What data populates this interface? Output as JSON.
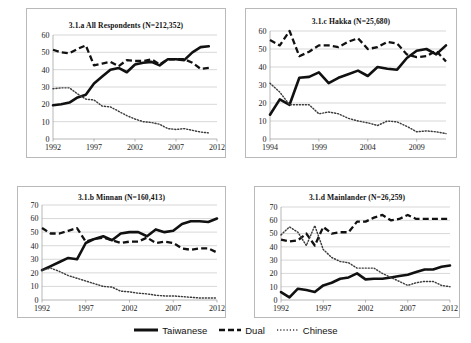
{
  "figure": {
    "legend": {
      "position": "bottom-center",
      "items": [
        {
          "label": "Taiwanese",
          "style": "solid",
          "color": "#111111"
        },
        {
          "label": "Dual",
          "style": "dashed",
          "color": "#111111"
        },
        {
          "label": "Chinese",
          "style": "dotted",
          "color": "#3c3c3c"
        }
      ]
    }
  },
  "chart_data": [
    {
      "id": "panel-a",
      "type": "line",
      "title": "3.1.a All Respondents (N=212,352)",
      "xlabel": "",
      "ylabel": "",
      "xlim": [
        1992,
        2012
      ],
      "ylim": [
        0,
        60
      ],
      "yticks": [
        0,
        10,
        20,
        30,
        40,
        50,
        60
      ],
      "xticks": [
        1992,
        1997,
        2002,
        2007,
        2012
      ],
      "grid": true,
      "x": [
        1992,
        1993,
        1994,
        1995,
        1996,
        1997,
        1998,
        1999,
        2000,
        2001,
        2002,
        2003,
        2004,
        2005,
        2006,
        2007,
        2008,
        2009,
        2010,
        2011
      ],
      "series": [
        {
          "name": "Taiwanese",
          "values": [
            19.5,
            20,
            21,
            24,
            25.5,
            32,
            36,
            40,
            41,
            38.5,
            43,
            44,
            44.5,
            42.5,
            46,
            46,
            45.5,
            50,
            53,
            53.5
          ]
        },
        {
          "name": "Dual",
          "values": [
            51.5,
            50,
            49.5,
            52,
            54,
            42.5,
            43.5,
            44.5,
            42,
            45.5,
            45,
            45,
            46,
            43,
            46,
            46,
            46,
            44,
            40.5,
            41
          ]
        },
        {
          "name": "Chinese",
          "values": [
            29,
            29.5,
            29.5,
            26,
            23,
            22.5,
            19,
            18.5,
            16,
            13.5,
            11.5,
            10,
            9.5,
            8.5,
            6,
            5.5,
            6,
            5,
            4,
            3.5
          ]
        }
      ]
    },
    {
      "id": "panel-c",
      "type": "line",
      "title": "3.1.c Hakka (N=25,680)",
      "xlabel": "",
      "ylabel": "",
      "xlim": [
        1994,
        2012
      ],
      "ylim": [
        0,
        60
      ],
      "yticks": [
        0,
        10,
        20,
        30,
        40,
        50,
        60
      ],
      "xticks": [
        1994,
        1999,
        2004,
        2009
      ],
      "grid": true,
      "x": [
        1994,
        1995,
        1996,
        1997,
        1998,
        1999,
        2000,
        2001,
        2002,
        2003,
        2004,
        2005,
        2006,
        2007,
        2008,
        2009,
        2010,
        2011,
        2012
      ],
      "series": [
        {
          "name": "Taiwanese",
          "values": [
            13.5,
            22,
            19,
            34,
            34.5,
            37,
            31,
            34,
            36,
            38,
            35,
            40,
            39,
            38.5,
            45,
            49,
            50,
            47,
            52
          ]
        },
        {
          "name": "Dual",
          "values": [
            55,
            52,
            60,
            46,
            48.5,
            52,
            52,
            51,
            54,
            56,
            50,
            51,
            54,
            53,
            47,
            45.5,
            46,
            49,
            43
          ]
        },
        {
          "name": "Chinese",
          "values": [
            31,
            26,
            19,
            19,
            19,
            14,
            15,
            14,
            11.5,
            10,
            9,
            7.5,
            10,
            9.5,
            7,
            4,
            4.5,
            4,
            3
          ]
        }
      ]
    },
    {
      "id": "panel-b",
      "type": "line",
      "title": "3.1.b Minnan (N=160,413)",
      "xlabel": "",
      "ylabel": "",
      "xlim": [
        1992,
        2012
      ],
      "ylim": [
        0,
        70
      ],
      "yticks": [
        0,
        10,
        20,
        30,
        40,
        50,
        60,
        70
      ],
      "xticks": [
        1992,
        1997,
        2002,
        2007,
        2012
      ],
      "grid": true,
      "x": [
        1992,
        1993,
        1994,
        1995,
        1996,
        1997,
        1998,
        1999,
        2000,
        2001,
        2002,
        2003,
        2004,
        2005,
        2006,
        2007,
        2008,
        2009,
        2010,
        2011,
        2012
      ],
      "series": [
        {
          "name": "Taiwanese",
          "values": [
            22,
            25,
            28,
            31,
            30,
            42,
            45,
            47,
            44,
            49,
            50,
            50,
            47,
            52,
            50,
            51,
            56,
            58,
            58,
            57.5,
            60
          ]
        },
        {
          "name": "Dual",
          "values": [
            53,
            49,
            49,
            51,
            53,
            43,
            45,
            46,
            44,
            42,
            43,
            43,
            46,
            42,
            43,
            42,
            38,
            37,
            38,
            38,
            35
          ]
        },
        {
          "name": "Chinese",
          "values": [
            22,
            23.5,
            21,
            18,
            16,
            14,
            12,
            10,
            9.5,
            6.5,
            6,
            5,
            4.5,
            3.5,
            3,
            3,
            2.5,
            2,
            1.5,
            1.5,
            1.5
          ]
        }
      ]
    },
    {
      "id": "panel-d",
      "type": "line",
      "title": "3.1.d Mainlander (N=26,259)",
      "xlabel": "",
      "ylabel": "",
      "xlim": [
        1992,
        2012
      ],
      "ylim": [
        0,
        70
      ],
      "yticks": [
        0,
        10,
        20,
        30,
        40,
        50,
        60,
        70
      ],
      "xticks": [
        1992,
        1997,
        2002,
        2007,
        2012
      ],
      "grid": true,
      "x": [
        1992,
        1993,
        1994,
        1995,
        1996,
        1997,
        1998,
        1999,
        2000,
        2001,
        2002,
        2003,
        2004,
        2005,
        2006,
        2007,
        2008,
        2009,
        2010,
        2011,
        2012
      ],
      "series": [
        {
          "name": "Taiwanese",
          "values": [
            6,
            2,
            8.5,
            7.5,
            6,
            11,
            13,
            16,
            17,
            20,
            15.5,
            16,
            16,
            17,
            18,
            19,
            21,
            23,
            23,
            25,
            26
          ]
        },
        {
          "name": "Dual",
          "values": [
            45.5,
            44,
            45,
            50,
            41,
            55,
            50,
            51,
            51,
            59,
            59,
            62,
            64,
            60,
            61,
            64,
            61,
            61,
            61,
            61,
            61
          ]
        },
        {
          "name": "Chinese",
          "values": [
            49,
            55,
            51,
            41,
            56,
            38,
            32,
            29,
            28,
            24,
            24,
            24,
            20,
            17,
            14,
            11,
            13,
            14,
            14,
            11,
            10
          ]
        }
      ]
    }
  ]
}
